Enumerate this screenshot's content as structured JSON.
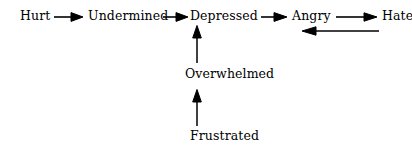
{
  "diagram": {
    "background_color": "#ffffff",
    "ink_color": "#000000",
    "nodes": {
      "hurt": "Hurt",
      "undermined": "Undermined",
      "depressed": "Depressed",
      "angry": "Angry",
      "hate": "Hate",
      "overwhelmed": "Overwhelmed",
      "frustrated": "Frustrated"
    },
    "edges": [
      {
        "id": "hurt-to-undermined",
        "from": "Hurt",
        "to": "Undermined",
        "direction": "right",
        "icon": "arrow-right-icon"
      },
      {
        "id": "undermined-to-depressed",
        "from": "Undermined",
        "to": "Depressed",
        "direction": "right",
        "icon": "arrow-right-icon"
      },
      {
        "id": "depressed-to-angry",
        "from": "Depressed",
        "to": "Angry",
        "direction": "right",
        "icon": "arrow-right-icon"
      },
      {
        "id": "angry-to-hate",
        "from": "Angry",
        "to": "Hate",
        "direction": "right",
        "icon": "arrow-right-icon"
      },
      {
        "id": "hate-to-angry-return",
        "from": "Hate",
        "to": "Angry",
        "direction": "left",
        "icon": "arrow-left-icon"
      },
      {
        "id": "overwhelmed-to-depressed",
        "from": "Overwhelmed",
        "to": "Depressed",
        "direction": "up",
        "icon": "arrow-up-icon"
      },
      {
        "id": "frustrated-to-overwhelmed",
        "from": "Frustrated",
        "to": "Overwhelmed",
        "direction": "up",
        "icon": "arrow-up-icon"
      }
    ]
  }
}
